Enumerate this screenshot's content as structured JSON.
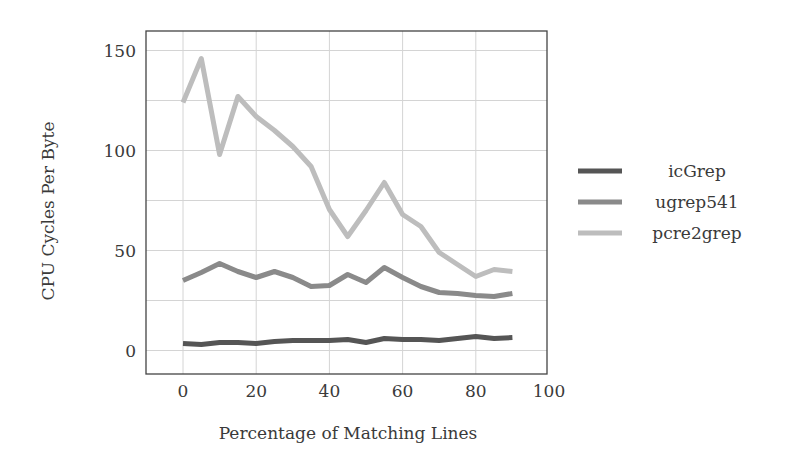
{
  "chart_data": {
    "type": "line",
    "title": "",
    "xlabel": "Percentage of Matching Lines",
    "ylabel": "CPU Cycles Per Byte",
    "xlim": [
      -10,
      100
    ],
    "ylim": [
      -12,
      160
    ],
    "xticks": [
      0,
      20,
      40,
      60,
      80,
      100
    ],
    "yticks": [
      0,
      50,
      100,
      150
    ],
    "x_grid": [
      0,
      20,
      40,
      60,
      80
    ],
    "y_grid": [
      0,
      25,
      50,
      75,
      100,
      125,
      150
    ],
    "grid": true,
    "legend_position": "right",
    "x": [
      0,
      5,
      10,
      15,
      20,
      25,
      30,
      35,
      40,
      45,
      50,
      55,
      60,
      65,
      70,
      75,
      80,
      85,
      90
    ],
    "series": [
      {
        "name": "icGrep",
        "color": "#555555",
        "values": [
          3.5,
          3,
          4,
          4,
          3.5,
          4.5,
          5,
          5,
          5,
          5.5,
          4,
          6,
          5.5,
          5.5,
          5,
          6,
          7,
          6,
          6.5
        ]
      },
      {
        "name": "ugrep541",
        "color": "#8a8a8a",
        "values": [
          35,
          39,
          43.5,
          39.5,
          36.5,
          39.5,
          36.5,
          32,
          32.5,
          38,
          34,
          41.5,
          36.5,
          32,
          29,
          28.5,
          27.5,
          27,
          28.5
        ]
      },
      {
        "name": "pcre2grep",
        "color": "#bdbdbd",
        "values": [
          124,
          146,
          98,
          127,
          117,
          110,
          102,
          92,
          70.5,
          57,
          70,
          84,
          68,
          62,
          49,
          43,
          37,
          40.5,
          39.5
        ]
      }
    ]
  }
}
